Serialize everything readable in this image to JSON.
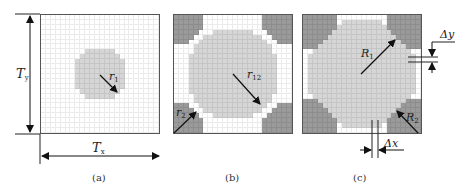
{
  "figure": {
    "panels": [
      {
        "id": "a",
        "caption": "(a)",
        "radius_label": "r",
        "radius_sub": "1"
      },
      {
        "id": "b",
        "caption": "(b)",
        "radius_label": "r",
        "radius_sub": "12",
        "corner_label": "r",
        "corner_sub": "2"
      },
      {
        "id": "c",
        "caption": "(c)",
        "radius_label": "R",
        "radius_sub": "1",
        "corner_label": "R",
        "corner_sub": "2"
      }
    ],
    "dimensions": {
      "Tx_label": "T",
      "Tx_sub": "x",
      "Ty_label": "T",
      "Ty_sub": "y",
      "dx_label": "Δx",
      "dy_label": "Δy"
    },
    "colors": {
      "background": "#ffffff",
      "inclusion_light": "#d6d6d6",
      "inclusion_dark": "#9a9a9a",
      "lines": "#222222"
    }
  }
}
